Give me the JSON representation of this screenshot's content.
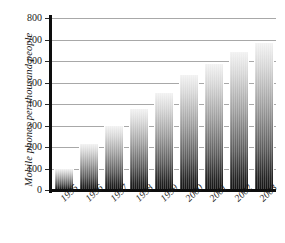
{
  "chart_data": {
    "type": "bar",
    "title": "",
    "subtitle": "",
    "xlabel": "",
    "ylabel": "Mobile phones per thousand people",
    "categories": [
      "1995",
      "1996",
      "1997",
      "1998",
      "1999",
      "2000",
      "2001",
      "2002",
      "2003"
    ],
    "values": [
      100,
      215,
      300,
      375,
      450,
      535,
      585,
      640,
      685
    ],
    "series": [
      {
        "name": "Mobile phones per thousand people",
        "values": [
          100,
          215,
          300,
          375,
          450,
          535,
          585,
          640,
          685
        ]
      }
    ],
    "ylim": [
      0,
      800
    ],
    "yticks": [
      0,
      100,
      200,
      300,
      400,
      500,
      600,
      700,
      800
    ],
    "ytick_labels": [
      "0",
      "100",
      "200",
      "300",
      "400",
      "500",
      "600",
      "700",
      "800"
    ],
    "grid": true,
    "grid_axis": "y",
    "legend": false,
    "legend_position": "none",
    "annotations": [],
    "bar_style": "vertical-gradient-light-top-dark-bottom",
    "colors": {
      "axis": "#0d0d0d",
      "gridline": "#a8a8a8",
      "text": "#1a1a1a",
      "bar_top": "#f2f2f2",
      "bar_bottom": "#141414",
      "background": "#ffffff"
    }
  }
}
